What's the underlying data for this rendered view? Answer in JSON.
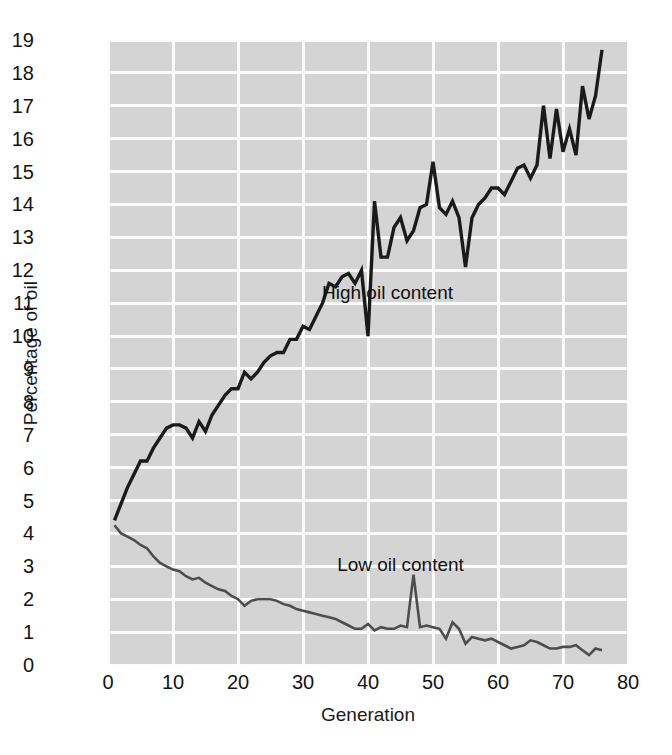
{
  "chart_data": {
    "type": "line",
    "title": "",
    "xlabel": "Generation",
    "ylabel": "Percentage of oil",
    "xlim": [
      0,
      80
    ],
    "ylim": [
      0,
      19
    ],
    "grid": true,
    "legend_position": "inline-annotation",
    "background_color": "#d4d4d4",
    "gridline_color": "#fbfbfb",
    "xticks": [
      "0",
      "10",
      "20",
      "30",
      "40",
      "50",
      "60",
      "70",
      "80"
    ],
    "xtick_values": [
      0,
      10,
      20,
      30,
      40,
      50,
      60,
      70,
      80
    ],
    "yticks": [
      "0",
      "1",
      "2",
      "3",
      "4",
      "5",
      "6",
      "7",
      "8",
      "9",
      "10",
      "11",
      "12",
      "13",
      "14",
      "15",
      "16",
      "17",
      "18",
      "19"
    ],
    "ytick_values": [
      0,
      1,
      2,
      3,
      4,
      5,
      6,
      7,
      8,
      9,
      10,
      11,
      12,
      13,
      14,
      15,
      16,
      17,
      18,
      19
    ],
    "annotations": [
      {
        "text": "High oil content",
        "x": 43,
        "y": 11.3
      },
      {
        "text": "Low oil content",
        "x": 45,
        "y": 3.05
      }
    ],
    "series": [
      {
        "name": "High oil content",
        "color": "#1a1a1a",
        "stroke_width": 3.4,
        "x": [
          1,
          2,
          3,
          4,
          5,
          6,
          7,
          8,
          9,
          10,
          11,
          12,
          13,
          14,
          15,
          16,
          17,
          18,
          19,
          20,
          21,
          22,
          23,
          24,
          25,
          26,
          27,
          28,
          29,
          30,
          31,
          32,
          33,
          34,
          35,
          36,
          37,
          38,
          39,
          40,
          41,
          42,
          43,
          44,
          45,
          46,
          47,
          48,
          49,
          50,
          51,
          52,
          53,
          54,
          55,
          56,
          57,
          58,
          59,
          60,
          61,
          62,
          63,
          64,
          65,
          66,
          67,
          68,
          69,
          70,
          71,
          72,
          73,
          74,
          75,
          76
        ],
        "values": [
          4.4,
          4.9,
          5.4,
          5.8,
          6.2,
          6.2,
          6.6,
          6.9,
          7.2,
          7.3,
          7.3,
          7.2,
          6.9,
          7.4,
          7.1,
          7.6,
          7.9,
          8.2,
          8.4,
          8.4,
          8.9,
          8.7,
          8.9,
          9.2,
          9.4,
          9.5,
          9.5,
          9.9,
          9.9,
          10.3,
          10.2,
          10.6,
          11.0,
          11.6,
          11.5,
          11.8,
          11.9,
          11.6,
          12.0,
          10.0,
          14.1,
          12.4,
          12.4,
          13.3,
          13.6,
          12.9,
          13.2,
          13.9,
          14.0,
          15.3,
          13.9,
          13.7,
          14.1,
          13.6,
          12.1,
          13.6,
          14.0,
          14.2,
          14.5,
          14.5,
          14.3,
          14.7,
          15.1,
          15.2,
          14.8,
          15.2,
          17.0,
          15.4,
          16.9,
          15.6,
          16.3,
          15.5,
          17.6,
          16.6,
          17.3,
          18.7
        ]
      },
      {
        "name": "Low oil content",
        "color": "#4d4d4d",
        "stroke_width": 2.6,
        "x": [
          1,
          2,
          3,
          4,
          5,
          6,
          7,
          8,
          9,
          10,
          11,
          12,
          13,
          14,
          15,
          16,
          17,
          18,
          19,
          20,
          21,
          22,
          23,
          24,
          25,
          26,
          27,
          28,
          29,
          30,
          31,
          32,
          33,
          34,
          35,
          36,
          37,
          38,
          39,
          40,
          41,
          42,
          43,
          44,
          45,
          46,
          47,
          48,
          49,
          50,
          51,
          52,
          53,
          54,
          55,
          56,
          57,
          58,
          59,
          60,
          61,
          62,
          63,
          64,
          65,
          66,
          67,
          68,
          69,
          70,
          71,
          72,
          73,
          74,
          75,
          76
        ],
        "values": [
          4.25,
          4.0,
          3.9,
          3.8,
          3.65,
          3.55,
          3.3,
          3.1,
          3.0,
          2.9,
          2.85,
          2.7,
          2.6,
          2.65,
          2.5,
          2.4,
          2.3,
          2.25,
          2.1,
          2.0,
          1.8,
          1.95,
          2.0,
          2.0,
          2.0,
          1.95,
          1.85,
          1.8,
          1.7,
          1.65,
          1.6,
          1.55,
          1.5,
          1.45,
          1.4,
          1.3,
          1.2,
          1.1,
          1.1,
          1.25,
          1.05,
          1.15,
          1.1,
          1.1,
          1.2,
          1.15,
          2.75,
          1.15,
          1.2,
          1.15,
          1.1,
          0.8,
          1.3,
          1.1,
          0.65,
          0.85,
          0.8,
          0.75,
          0.8,
          0.7,
          0.6,
          0.5,
          0.55,
          0.6,
          0.75,
          0.7,
          0.6,
          0.5,
          0.5,
          0.55,
          0.55,
          0.6,
          0.45,
          0.3,
          0.5,
          0.45
        ]
      }
    ]
  }
}
